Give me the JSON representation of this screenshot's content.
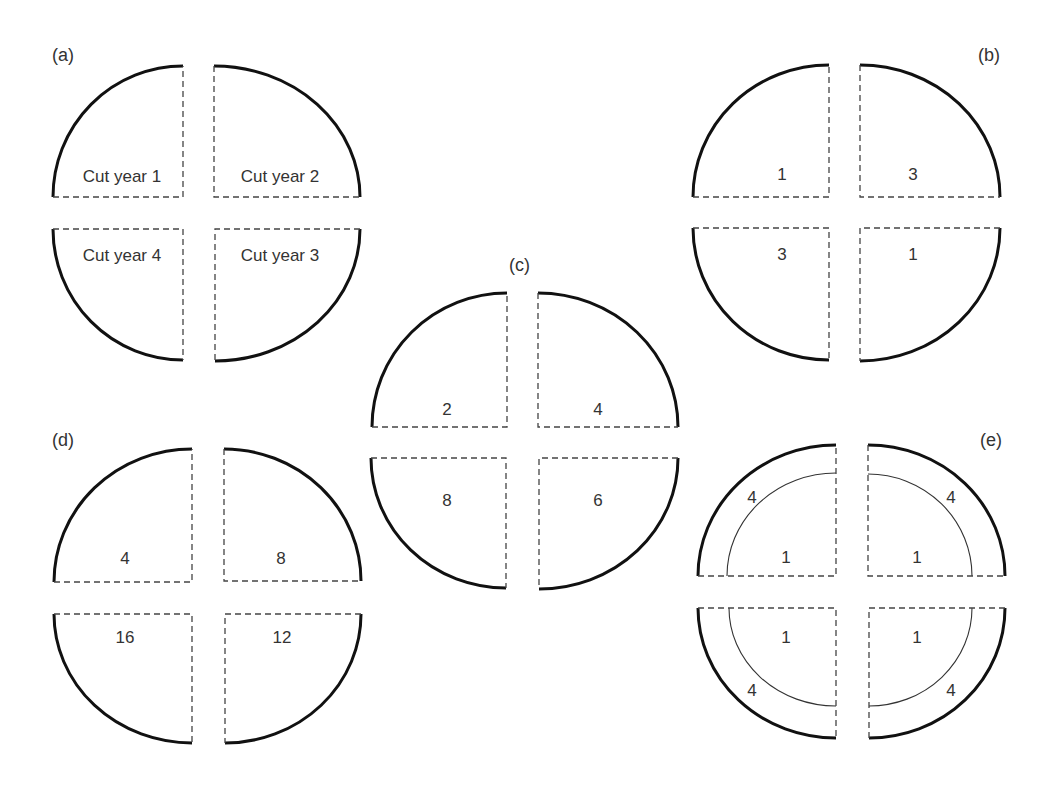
{
  "figure": {
    "panels": [
      {
        "id": "a",
        "label": "(a)",
        "quadrants": {
          "top_left": "Cut year 1",
          "top_right": "Cut year 2",
          "bottom_right": "Cut year 3",
          "bottom_left": "Cut year 4"
        }
      },
      {
        "id": "b",
        "label": "(b)",
        "quadrants": {
          "top_left": "1",
          "top_right": "3",
          "bottom_left": "3",
          "bottom_right": "1"
        }
      },
      {
        "id": "c",
        "label": "(c)",
        "quadrants": {
          "top_left": "2",
          "top_right": "4",
          "bottom_left": "8",
          "bottom_right": "6"
        }
      },
      {
        "id": "d",
        "label": "(d)",
        "quadrants": {
          "top_left": "4",
          "top_right": "8",
          "bottom_left": "16",
          "bottom_right": "12"
        }
      },
      {
        "id": "e",
        "label": "(e)",
        "quadrants": {
          "top_left_outer": "4",
          "top_left_inner": "1",
          "top_right_outer": "4",
          "top_right_inner": "1",
          "bottom_left_outer": "4",
          "bottom_left_inner": "1",
          "bottom_right_outer": "4",
          "bottom_right_inner": "1"
        }
      }
    ]
  },
  "colors": {
    "outline": "#111111",
    "dashed": "#444444",
    "text": "#333333",
    "background": "#ffffff"
  }
}
